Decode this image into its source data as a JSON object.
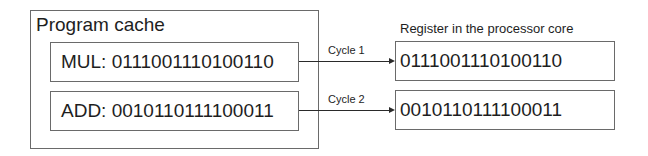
{
  "program_cache": {
    "title": "Program cache",
    "instructions": [
      {
        "text": "MUL: 0111001110100110"
      },
      {
        "text": "ADD: 0010110111100011"
      }
    ]
  },
  "transfers": [
    {
      "label": "Cycle 1"
    },
    {
      "label": "Cycle 2"
    }
  ],
  "register": {
    "title": "Register in the processor core",
    "values": [
      {
        "text": "0111001110100110"
      },
      {
        "text": "0010110111100011"
      }
    ]
  }
}
